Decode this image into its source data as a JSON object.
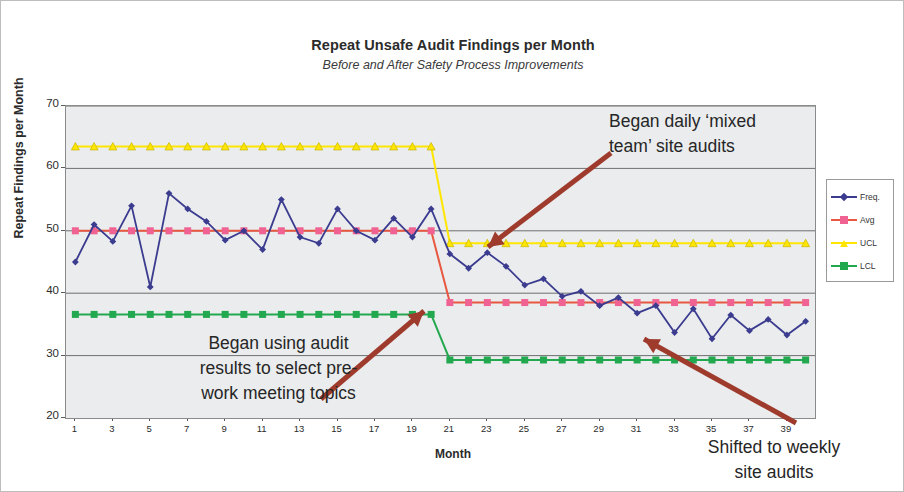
{
  "chart_data": {
    "type": "line",
    "title": "Repeat Unsafe Audit Findings per Month",
    "subtitle": "Before and After Safety Process Improvements",
    "xlabel": "Month",
    "ylabel": "Repeat Findings per Month",
    "ylim": [
      20,
      70
    ],
    "yticks": [
      20,
      30,
      40,
      50,
      60,
      70
    ],
    "xlim": [
      1,
      40
    ],
    "xticks": [
      1,
      3,
      5,
      7,
      9,
      11,
      13,
      15,
      17,
      19,
      21,
      23,
      25,
      27,
      29,
      31,
      33,
      35,
      37,
      39
    ],
    "grid": "horizontal",
    "legend_position": "right-outside",
    "x": [
      1,
      2,
      3,
      4,
      5,
      6,
      7,
      8,
      9,
      10,
      11,
      12,
      13,
      14,
      15,
      16,
      17,
      18,
      19,
      20,
      21,
      22,
      23,
      24,
      25,
      26,
      27,
      28,
      29,
      30,
      31,
      32,
      33,
      34,
      35,
      36,
      37,
      38,
      39,
      40
    ],
    "series": [
      {
        "name": "Freq.",
        "color": "#3b3b8f",
        "marker": "diamond",
        "values": [
          45.0,
          51.0,
          48.3,
          54.0,
          41.0,
          56.0,
          53.5,
          51.5,
          48.5,
          50.0,
          47.0,
          55.0,
          49.0,
          48.0,
          53.5,
          50.0,
          48.5,
          52.0,
          49.0,
          53.5,
          46.3,
          44.0,
          46.5,
          44.3,
          41.3,
          42.3,
          39.5,
          40.3,
          38.0,
          39.3,
          36.8,
          38.0,
          33.7,
          37.5,
          32.7,
          36.5,
          34.0,
          35.8,
          33.3,
          35.5
        ]
      },
      {
        "name": "Avg",
        "color": "#f06292",
        "line_color": "#e8573f",
        "marker": "square",
        "values": [
          50.0,
          50.0,
          50.0,
          50.0,
          50.0,
          50.0,
          50.0,
          50.0,
          50.0,
          50.0,
          50.0,
          50.0,
          50.0,
          50.0,
          50.0,
          50.0,
          50.0,
          50.0,
          50.0,
          50.0,
          38.5,
          38.5,
          38.5,
          38.5,
          38.5,
          38.5,
          38.5,
          38.5,
          38.5,
          38.5,
          38.5,
          38.5,
          38.5,
          38.5,
          38.5,
          38.5,
          38.5,
          38.5,
          38.5,
          38.5
        ]
      },
      {
        "name": "UCL",
        "color": "#ffe600",
        "marker": "triangle",
        "values": [
          63.5,
          63.5,
          63.5,
          63.5,
          63.5,
          63.5,
          63.5,
          63.5,
          63.5,
          63.5,
          63.5,
          63.5,
          63.5,
          63.5,
          63.5,
          63.5,
          63.5,
          63.5,
          63.5,
          63.5,
          48.0,
          48.0,
          48.0,
          48.0,
          48.0,
          48.0,
          48.0,
          48.0,
          48.0,
          48.0,
          48.0,
          48.0,
          48.0,
          48.0,
          48.0,
          48.0,
          48.0,
          48.0,
          48.0,
          48.0
        ]
      },
      {
        "name": "LCL",
        "color": "#22a84f",
        "marker": "square",
        "values": [
          36.6,
          36.6,
          36.6,
          36.6,
          36.6,
          36.6,
          36.6,
          36.6,
          36.6,
          36.6,
          36.6,
          36.6,
          36.6,
          36.6,
          36.6,
          36.6,
          36.6,
          36.6,
          36.6,
          36.6,
          29.3,
          29.3,
          29.3,
          29.3,
          29.3,
          29.3,
          29.3,
          29.3,
          29.3,
          29.3,
          29.3,
          29.3,
          29.3,
          29.3,
          29.3,
          29.3,
          29.3,
          29.3,
          29.3,
          29.3
        ]
      }
    ],
    "annotations": [
      {
        "id": "anno1",
        "lines": [
          "Began daily ‘mixed",
          "team’ site audits"
        ],
        "arrow": {
          "from_x": 610,
          "from_y": 152,
          "to_x": 487,
          "to_y": 246
        }
      },
      {
        "id": "anno2",
        "lines": [
          "Began using audit",
          "results to select pre-",
          "work meeting topics"
        ],
        "arrow": {
          "from_x": 320,
          "from_y": 398,
          "to_x": 423,
          "to_y": 310
        }
      },
      {
        "id": "anno3",
        "lines": [
          "Shifted to weekly",
          "site audits"
        ],
        "arrow": {
          "from_x": 795,
          "from_y": 422,
          "to_x": 643,
          "to_y": 338
        }
      }
    ],
    "arrow_color": "#9e3b2c"
  }
}
